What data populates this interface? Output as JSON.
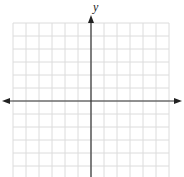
{
  "diagram": {
    "type": "coordinate-plane",
    "title_clipped": "",
    "axes": {
      "x_label": "",
      "y_label": "y",
      "x_arrows": "both",
      "y_arrows": "top"
    },
    "grid": {
      "columns": 12,
      "rows_above_x_axis": 6,
      "rows_below_x_axis": 6,
      "cell_px": 13,
      "tick_labels": false
    },
    "colors": {
      "grid": "#dcdcdc",
      "axis": "#333333",
      "background": "#ffffff"
    }
  }
}
